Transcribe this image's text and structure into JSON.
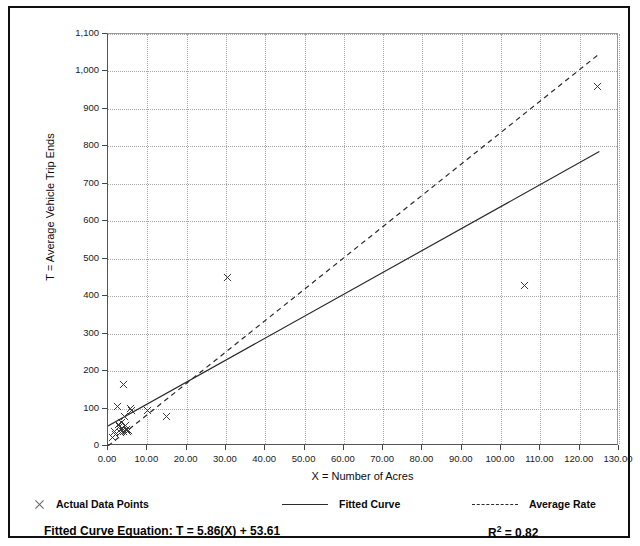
{
  "chart_data": {
    "type": "scatter",
    "title": "",
    "xlabel": "X = Number of Acres",
    "ylabel": "T = Average Vehicle Trip Ends",
    "xlim": [
      0,
      130
    ],
    "ylim": [
      0,
      1100
    ],
    "xtick_step": 10,
    "ytick_step": 100,
    "grid": true,
    "xticks": [
      "0.00",
      "10.00",
      "20.00",
      "30.00",
      "40.00",
      "50.00",
      "60.00",
      "70.00",
      "80.00",
      "90.00",
      "100.00",
      "110.00",
      "120.00",
      "130.00"
    ],
    "yticks": [
      "0",
      "100",
      "200",
      "300",
      "400",
      "500",
      "600",
      "700",
      "800",
      "900",
      "1,000",
      "1,100"
    ],
    "series": [
      {
        "name": "Actual Data Points",
        "type": "scatter",
        "marker": "x",
        "points": [
          [
            1.2,
            22
          ],
          [
            1.6,
            40
          ],
          [
            2.0,
            30
          ],
          [
            2.3,
            105
          ],
          [
            2.6,
            58
          ],
          [
            2.9,
            52
          ],
          [
            3.1,
            44
          ],
          [
            3.3,
            36
          ],
          [
            3.5,
            62
          ],
          [
            3.7,
            48
          ],
          [
            3.9,
            40
          ],
          [
            4.0,
            163
          ],
          [
            4.2,
            80
          ],
          [
            4.4,
            56
          ],
          [
            4.6,
            44
          ],
          [
            4.9,
            38
          ],
          [
            5.2,
            42
          ],
          [
            5.6,
            100
          ],
          [
            6.0,
            96
          ],
          [
            10.1,
            96
          ],
          [
            15.0,
            79
          ],
          [
            30.5,
            450
          ],
          [
            106.0,
            428
          ],
          [
            124.5,
            960
          ]
        ]
      },
      {
        "name": "Fitted Curve",
        "type": "line",
        "style": "solid",
        "endpoints": [
          [
            0,
            53.61
          ],
          [
            125,
            786.11
          ]
        ]
      },
      {
        "name": "Average Rate",
        "type": "line",
        "style": "dashed",
        "endpoints": [
          [
            0,
            0
          ],
          [
            125,
            1047
          ]
        ]
      }
    ],
    "annotations": {
      "fitted_curve_equation": "Fitted Curve Equation:  T = 5.86(X) + 53.61",
      "r_squared_prefix": "R",
      "r_squared_sup": "2",
      "r_squared_value": " = 0.82"
    }
  },
  "legend": {
    "position": "below-axis",
    "items": [
      {
        "label": "Actual Data Points",
        "swatch": "x-marker"
      },
      {
        "label": "Fitted Curve",
        "swatch": "solid-line"
      },
      {
        "label": "Average Rate",
        "swatch": "dashed-line"
      }
    ]
  },
  "colors": {
    "frame": "#101010",
    "grid": "#a8a8a8",
    "marker": "#3a3a3a",
    "line": "#2b2b2b",
    "text": "#0d0d0d",
    "background": "#ffffff"
  }
}
